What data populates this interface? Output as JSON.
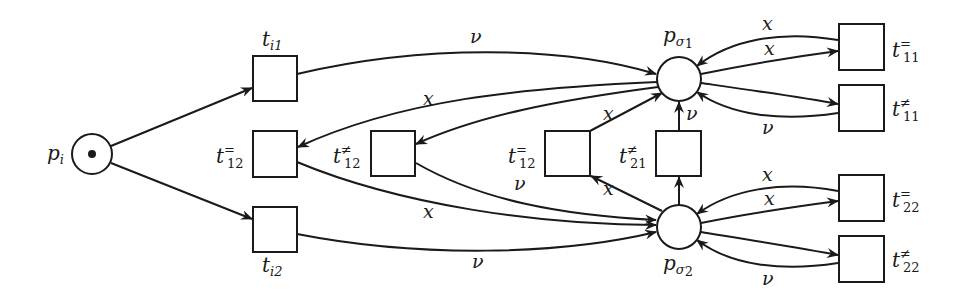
{
  "diagram": {
    "type": "petri-net",
    "places": [
      {
        "id": "p_i",
        "base": "p",
        "sub": "i",
        "token": true
      },
      {
        "id": "p_sigma1",
        "base": "p",
        "sub": "σ",
        "subsub": "1",
        "token": false
      },
      {
        "id": "p_sigma2",
        "base": "p",
        "sub": "σ",
        "subsub": "2",
        "token": false
      }
    ],
    "transitions": [
      {
        "id": "t_i1",
        "base": "t",
        "sub": "i1",
        "sup": ""
      },
      {
        "id": "t_12_eq_left",
        "base": "t",
        "sub": "12",
        "sup": "="
      },
      {
        "id": "t_i2",
        "base": "t",
        "sub": "i2",
        "sup": ""
      },
      {
        "id": "t_12_neq",
        "base": "t",
        "sub": "12",
        "sup": "≠"
      },
      {
        "id": "t_12_eq_mid",
        "base": "t",
        "sub": "12",
        "sup": "="
      },
      {
        "id": "t_21_neq",
        "base": "t",
        "sub": "21",
        "sup": "≠"
      },
      {
        "id": "t_11_eq",
        "base": "t",
        "sub": "11",
        "sup": "="
      },
      {
        "id": "t_11_neq",
        "base": "t",
        "sub": "11",
        "sup": "≠"
      },
      {
        "id": "t_22_eq",
        "base": "t",
        "sub": "22",
        "sup": "="
      },
      {
        "id": "t_22_neq",
        "base": "t",
        "sub": "22",
        "sup": "≠"
      }
    ],
    "arc_labels": {
      "nu": "ν",
      "x": "x"
    },
    "arcs": [
      {
        "from": "p_i",
        "to": "t_i1",
        "label": ""
      },
      {
        "from": "p_i",
        "to": "t_i2",
        "label": ""
      },
      {
        "from": "t_i1",
        "to": "p_sigma1",
        "label": "ν"
      },
      {
        "from": "p_sigma1",
        "to": "t_12_eq_left",
        "label": "x"
      },
      {
        "from": "p_sigma1",
        "to": "t_12_neq",
        "label": ""
      },
      {
        "from": "t_12_eq_left",
        "to": "p_sigma2",
        "label": "x"
      },
      {
        "from": "t_12_neq",
        "to": "p_sigma2",
        "label": "ν"
      },
      {
        "from": "t_i2",
        "to": "p_sigma2",
        "label": "ν"
      },
      {
        "from": "t_12_eq_mid",
        "to": "p_sigma1",
        "label": "x"
      },
      {
        "from": "p_sigma2",
        "to": "t_12_eq_mid",
        "label": "x"
      },
      {
        "from": "p_sigma2",
        "to": "t_21_neq",
        "label": ""
      },
      {
        "from": "t_21_neq",
        "to": "p_sigma1",
        "label": "ν"
      },
      {
        "from": "t_11_eq",
        "to": "p_sigma1",
        "label": "x"
      },
      {
        "from": "p_sigma1",
        "to": "t_11_eq",
        "label": "x"
      },
      {
        "from": "p_sigma1",
        "to": "t_11_neq",
        "label": ""
      },
      {
        "from": "t_11_neq",
        "to": "p_sigma1",
        "label": "ν"
      },
      {
        "from": "t_22_eq",
        "to": "p_sigma2",
        "label": "x"
      },
      {
        "from": "p_sigma2",
        "to": "t_22_eq",
        "label": "x"
      },
      {
        "from": "p_sigma2",
        "to": "t_22_neq",
        "label": ""
      },
      {
        "from": "t_22_neq",
        "to": "p_sigma2",
        "label": "ν"
      }
    ]
  }
}
